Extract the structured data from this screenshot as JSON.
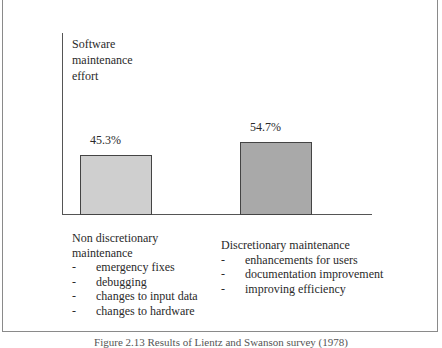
{
  "chart_data": {
    "type": "bar",
    "title": "",
    "ylabel": "Software maintenance effort",
    "xlabel": "",
    "categories": [
      "Non discretionary maintenance",
      "Discretionary maintenance"
    ],
    "values": [
      45.3,
      54.7
    ],
    "value_labels": [
      "45.3%",
      "54.7%"
    ],
    "colors": [
      "#cfcfcf",
      "#a9a9a9"
    ],
    "ylim": [
      0,
      100
    ],
    "grid": false,
    "legend": "none"
  },
  "axis": {
    "title_lines": [
      "Software",
      "maintenance",
      "effort"
    ]
  },
  "bars": [
    {
      "label": "45.3%",
      "value": 45.3,
      "color": "#cfcfcf"
    },
    {
      "label": "54.7%",
      "value": 54.7,
      "color": "#a9a9a9"
    }
  ],
  "groups": [
    {
      "title_lines": [
        "Non discretionary",
        "maintenance"
      ],
      "bullet": "-",
      "items": [
        "emergency fixes",
        "debugging",
        "changes to input data",
        "changes to hardware"
      ]
    },
    {
      "title_lines": [
        "Discretionary maintenance"
      ],
      "bullet": "-",
      "items": [
        "enhancements for users",
        "documentation improvement",
        "improving efficiency"
      ]
    }
  ],
  "caption": "Figure 2.13 Results of Lientz and Swanson survey (1978)"
}
